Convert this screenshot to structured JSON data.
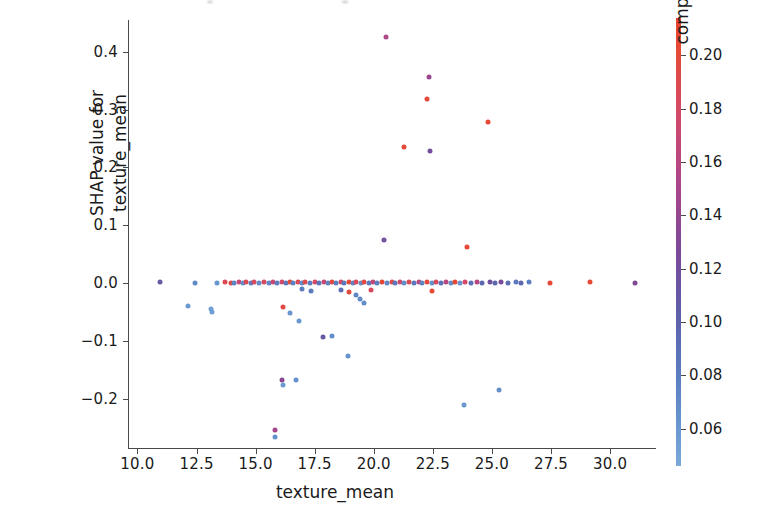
{
  "figure": {
    "width": 775,
    "height": 522,
    "background": "#ffffff",
    "type": "shap-dependence-plot"
  },
  "chart_data": {
    "type": "scatter",
    "title": "",
    "xlabel": "texture_mean",
    "ylabel": "SHAP value for\ntexture_mean",
    "ylabel_lines": [
      "SHAP value for",
      "texture_mean"
    ],
    "xlim": [
      9.6,
      31.9
    ],
    "ylim": [
      -0.285,
      0.455
    ],
    "xticks": [
      10.0,
      12.5,
      15.0,
      17.5,
      20.0,
      22.5,
      25.0,
      27.5,
      30.0
    ],
    "xticklabels": [
      "10.0",
      "12.5",
      "15.0",
      "17.5",
      "20.0",
      "22.5",
      "25.0",
      "27.5",
      "30.0"
    ],
    "yticks": [
      -0.2,
      -0.1,
      0.0,
      0.1,
      0.2,
      0.3,
      0.4
    ],
    "yticklabels": [
      "−0.2",
      "−0.1",
      "0.0",
      "0.1",
      "0.2",
      "0.3",
      "0.4"
    ],
    "grid": false,
    "legend": null,
    "colorbar": {
      "label": "compactness_mean",
      "vmin": 0.046,
      "vmax": 0.214,
      "ticks": [
        0.06,
        0.08,
        0.1,
        0.12,
        0.14,
        0.16,
        0.18,
        0.2
      ],
      "ticklabels": [
        "0.06",
        "0.08",
        "0.10",
        "0.12",
        "0.14",
        "0.16",
        "0.18",
        "0.20"
      ],
      "cmap": "shap_red_blue",
      "low_color": "#7aa8d8",
      "mid_color": "#7b4898",
      "high_color": "#e8442e",
      "position": "right"
    },
    "marker_size": 5,
    "points": [
      {
        "x": 20.5,
        "y": 0.425,
        "c": 0.16
      },
      {
        "x": 22.35,
        "y": 0.357,
        "c": 0.15
      },
      {
        "x": 22.25,
        "y": 0.319,
        "c": 0.2
      },
      {
        "x": 24.85,
        "y": 0.279,
        "c": 0.205
      },
      {
        "x": 21.3,
        "y": 0.236,
        "c": 0.204
      },
      {
        "x": 22.4,
        "y": 0.228,
        "c": 0.128
      },
      {
        "x": 20.45,
        "y": 0.075,
        "c": 0.124
      },
      {
        "x": 23.95,
        "y": 0.063,
        "c": 0.203
      },
      {
        "x": 10.95,
        "y": 0.002,
        "c": 0.12
      },
      {
        "x": 12.45,
        "y": 0.001,
        "c": 0.08
      },
      {
        "x": 13.35,
        "y": 0.001,
        "c": 0.07
      },
      {
        "x": 13.7,
        "y": 0.002,
        "c": 0.19
      },
      {
        "x": 13.95,
        "y": 0.001,
        "c": 0.195
      },
      {
        "x": 14.1,
        "y": 0.001,
        "c": 0.085
      },
      {
        "x": 14.3,
        "y": 0.002,
        "c": 0.175
      },
      {
        "x": 14.45,
        "y": 0.001,
        "c": 0.075
      },
      {
        "x": 14.6,
        "y": 0.002,
        "c": 0.19
      },
      {
        "x": 14.8,
        "y": 0.001,
        "c": 0.09
      },
      {
        "x": 14.95,
        "y": 0.002,
        "c": 0.185
      },
      {
        "x": 15.15,
        "y": 0.001,
        "c": 0.078
      },
      {
        "x": 15.35,
        "y": 0.002,
        "c": 0.186
      },
      {
        "x": 15.55,
        "y": 0.001,
        "c": 0.082
      },
      {
        "x": 15.75,
        "y": 0.002,
        "c": 0.175
      },
      {
        "x": 15.9,
        "y": 0.001,
        "c": 0.088
      },
      {
        "x": 16.1,
        "y": 0.002,
        "c": 0.18
      },
      {
        "x": 16.3,
        "y": 0.001,
        "c": 0.092
      },
      {
        "x": 16.45,
        "y": 0.002,
        "c": 0.2
      },
      {
        "x": 16.6,
        "y": 0.001,
        "c": 0.086
      },
      {
        "x": 16.8,
        "y": 0.002,
        "c": 0.188
      },
      {
        "x": 16.95,
        "y": 0.001,
        "c": 0.079
      },
      {
        "x": 17.1,
        "y": 0.002,
        "c": 0.193
      },
      {
        "x": 17.3,
        "y": 0.001,
        "c": 0.09
      },
      {
        "x": 17.5,
        "y": 0.002,
        "c": 0.184
      },
      {
        "x": 17.7,
        "y": 0.001,
        "c": 0.095
      },
      {
        "x": 17.9,
        "y": 0.002,
        "c": 0.176
      },
      {
        "x": 18.05,
        "y": 0.001,
        "c": 0.084
      },
      {
        "x": 18.25,
        "y": 0.002,
        "c": 0.198
      },
      {
        "x": 18.4,
        "y": 0.001,
        "c": 0.089
      },
      {
        "x": 18.6,
        "y": 0.002,
        "c": 0.182
      },
      {
        "x": 18.75,
        "y": 0.001,
        "c": 0.093
      },
      {
        "x": 18.95,
        "y": 0.002,
        "c": 0.206
      },
      {
        "x": 19.1,
        "y": 0.001,
        "c": 0.083
      },
      {
        "x": 19.25,
        "y": 0.002,
        "c": 0.189
      },
      {
        "x": 19.45,
        "y": 0.001,
        "c": 0.077
      },
      {
        "x": 19.6,
        "y": 0.002,
        "c": 0.196
      },
      {
        "x": 19.8,
        "y": 0.001,
        "c": 0.091
      },
      {
        "x": 19.95,
        "y": 0.002,
        "c": 0.172
      },
      {
        "x": 20.15,
        "y": 0.001,
        "c": 0.087
      },
      {
        "x": 20.35,
        "y": 0.002,
        "c": 0.202
      },
      {
        "x": 20.55,
        "y": 0.001,
        "c": 0.081
      },
      {
        "x": 20.75,
        "y": 0.002,
        "c": 0.194
      },
      {
        "x": 20.9,
        "y": 0.001,
        "c": 0.096
      },
      {
        "x": 21.1,
        "y": 0.002,
        "c": 0.179
      },
      {
        "x": 21.3,
        "y": 0.001,
        "c": 0.076
      },
      {
        "x": 21.5,
        "y": 0.002,
        "c": 0.191
      },
      {
        "x": 21.7,
        "y": 0.001,
        "c": 0.094
      },
      {
        "x": 21.9,
        "y": 0.002,
        "c": 0.168
      },
      {
        "x": 22.05,
        "y": 0.001,
        "c": 0.085
      },
      {
        "x": 22.25,
        "y": 0.002,
        "c": 0.199
      },
      {
        "x": 22.45,
        "y": 0.001,
        "c": 0.074
      },
      {
        "x": 22.65,
        "y": 0.002,
        "c": 0.187
      },
      {
        "x": 22.85,
        "y": 0.001,
        "c": 0.098
      },
      {
        "x": 23.05,
        "y": 0.002,
        "c": 0.166
      },
      {
        "x": 23.25,
        "y": 0.001,
        "c": 0.08
      },
      {
        "x": 23.45,
        "y": 0.002,
        "c": 0.207
      },
      {
        "x": 23.65,
        "y": 0.001,
        "c": 0.072
      },
      {
        "x": 23.85,
        "y": 0.002,
        "c": 0.183
      },
      {
        "x": 24.1,
        "y": 0.001,
        "c": 0.099
      },
      {
        "x": 24.35,
        "y": 0.002,
        "c": 0.165
      },
      {
        "x": 24.6,
        "y": 0.001,
        "c": 0.104
      },
      {
        "x": 24.9,
        "y": 0.002,
        "c": 0.126
      },
      {
        "x": 25.15,
        "y": 0.001,
        "c": 0.108
      },
      {
        "x": 25.4,
        "y": 0.002,
        "c": 0.132
      },
      {
        "x": 25.7,
        "y": 0.001,
        "c": 0.101
      },
      {
        "x": 26.0,
        "y": 0.002,
        "c": 0.093
      },
      {
        "x": 26.25,
        "y": 0.001,
        "c": 0.106
      },
      {
        "x": 26.55,
        "y": 0.002,
        "c": 0.088
      },
      {
        "x": 27.45,
        "y": 0.001,
        "c": 0.204
      },
      {
        "x": 29.15,
        "y": 0.002,
        "c": 0.202
      },
      {
        "x": 31.05,
        "y": 0.001,
        "c": 0.135
      },
      {
        "x": 18.6,
        "y": -0.012,
        "c": 0.1
      },
      {
        "x": 18.95,
        "y": -0.016,
        "c": 0.198
      },
      {
        "x": 19.25,
        "y": -0.021,
        "c": 0.082
      },
      {
        "x": 19.4,
        "y": -0.028,
        "c": 0.079
      },
      {
        "x": 19.6,
        "y": -0.034,
        "c": 0.076
      },
      {
        "x": 16.95,
        "y": -0.01,
        "c": 0.09
      },
      {
        "x": 17.35,
        "y": -0.014,
        "c": 0.093
      },
      {
        "x": 19.9,
        "y": -0.012,
        "c": 0.186
      },
      {
        "x": 22.45,
        "y": -0.014,
        "c": 0.205
      },
      {
        "x": 12.15,
        "y": -0.04,
        "c": 0.066
      },
      {
        "x": 13.1,
        "y": -0.044,
        "c": 0.06
      },
      {
        "x": 13.15,
        "y": -0.05,
        "c": 0.058
      },
      {
        "x": 16.15,
        "y": -0.042,
        "c": 0.196
      },
      {
        "x": 16.45,
        "y": -0.052,
        "c": 0.07
      },
      {
        "x": 16.85,
        "y": -0.065,
        "c": 0.068
      },
      {
        "x": 17.85,
        "y": -0.093,
        "c": 0.118
      },
      {
        "x": 18.25,
        "y": -0.092,
        "c": 0.075
      },
      {
        "x": 18.9,
        "y": -0.126,
        "c": 0.071
      },
      {
        "x": 16.1,
        "y": -0.168,
        "c": 0.142
      },
      {
        "x": 16.15,
        "y": -0.176,
        "c": 0.066
      },
      {
        "x": 16.7,
        "y": -0.168,
        "c": 0.073
      },
      {
        "x": 23.8,
        "y": -0.21,
        "c": 0.069
      },
      {
        "x": 25.3,
        "y": -0.185,
        "c": 0.074
      },
      {
        "x": 15.8,
        "y": -0.254,
        "c": 0.156
      },
      {
        "x": 15.8,
        "y": -0.266,
        "c": 0.072
      }
    ]
  }
}
